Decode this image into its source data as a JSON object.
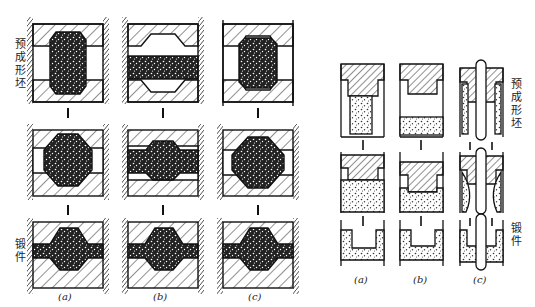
{
  "left_figure": {
    "labels": {
      "preform": "预成形坯",
      "forging": "锻件"
    },
    "captions": [
      "(a)",
      "(b)",
      "(c)"
    ]
  },
  "right_figure": {
    "labels": {
      "preform": "预成形坯",
      "forging": "锻件"
    },
    "captions": [
      "(a)",
      "(b)",
      "(c)"
    ]
  }
}
